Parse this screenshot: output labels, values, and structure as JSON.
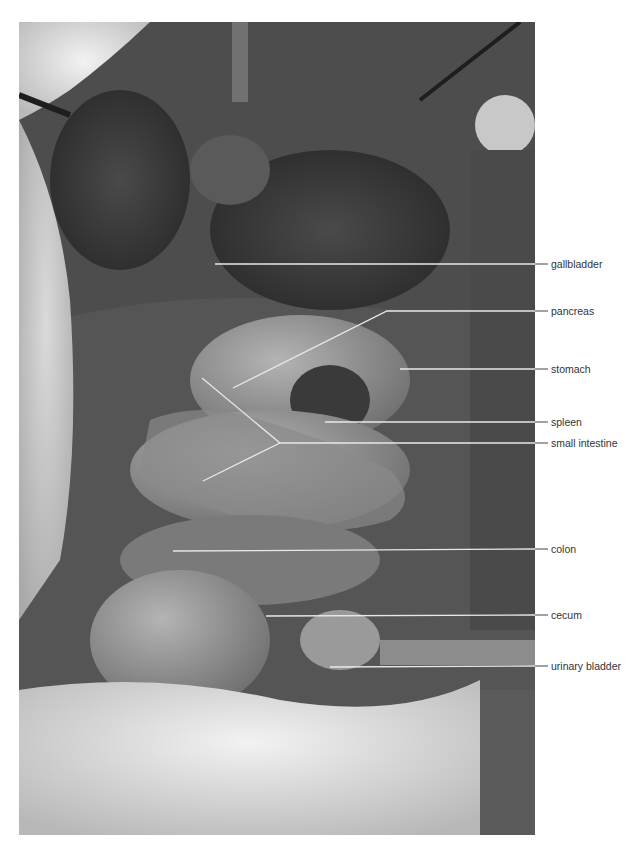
{
  "figure": {
    "labels": [
      {
        "id": "gallbladder",
        "text": "gallbladder"
      },
      {
        "id": "pancreas",
        "text": "pancreas"
      },
      {
        "id": "stomach",
        "text": "stomach"
      },
      {
        "id": "spleen",
        "text": "spleen"
      },
      {
        "id": "small-intestine",
        "text": "small intestine"
      },
      {
        "id": "colon",
        "text": "colon"
      },
      {
        "id": "cecum",
        "text": "cecum"
      },
      {
        "id": "urinary-bladder",
        "text": "urinary bladder"
      }
    ],
    "colors": {
      "leader_line_inside": "#e8e8e8",
      "leader_line_outside": "#444444",
      "label_text": "#333333"
    }
  }
}
